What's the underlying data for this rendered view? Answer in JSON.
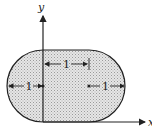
{
  "diagram": {
    "shape": "stadium (rectangle with semicircular ends), shaded region",
    "axes": {
      "x_label": "x",
      "y_label": "y"
    },
    "dimensions": [
      {
        "id": "left-radius",
        "label": "1"
      },
      {
        "id": "top-length",
        "label": "1"
      },
      {
        "id": "right-radius",
        "label": "1"
      }
    ],
    "colors": {
      "fill": "#d9d9d9",
      "stroke": "#222222"
    }
  }
}
